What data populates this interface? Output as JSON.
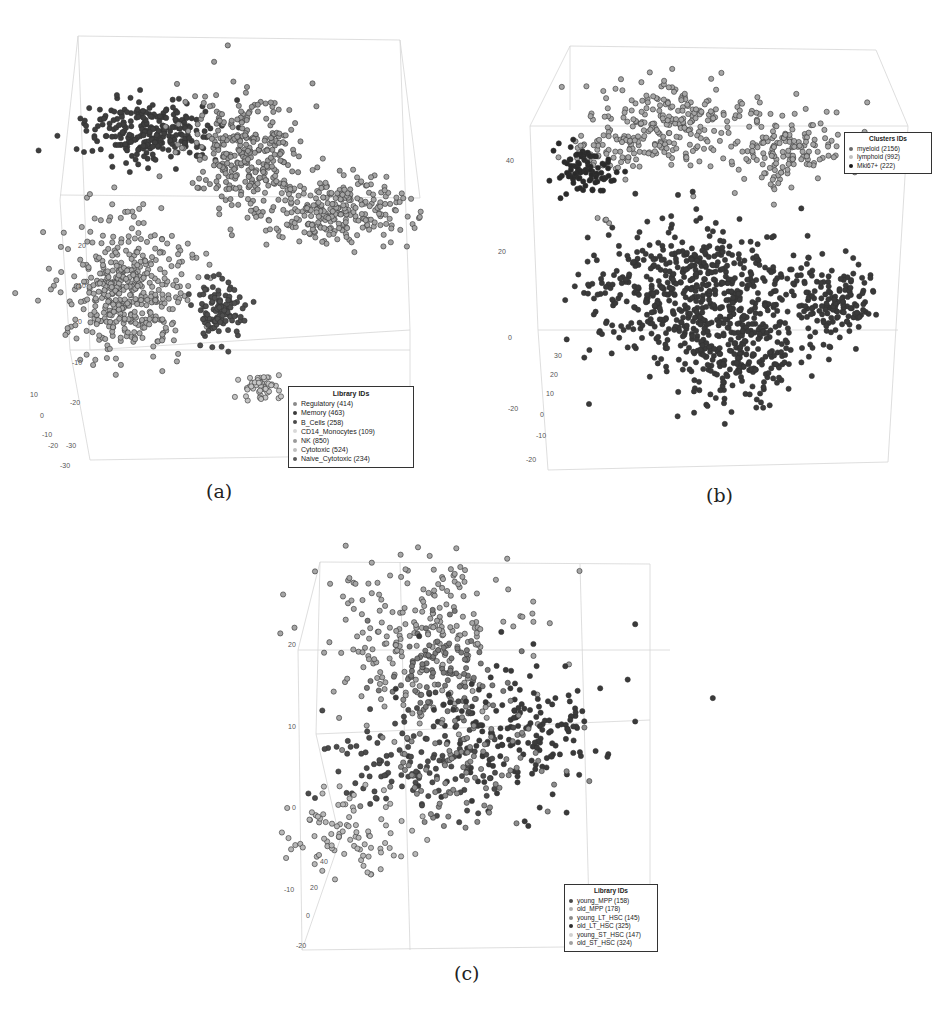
{
  "figure": {
    "captions": [
      "(a)",
      "(b)",
      "(c)"
    ]
  },
  "chart_data": [
    {
      "type": "scatter",
      "subtype": "3d-scatter",
      "panel": "(a)",
      "title": "",
      "legend_title": "Library IDs",
      "legend_position": "bottom-right",
      "series": [
        {
          "name": "Regulatory (414)",
          "count": 414,
          "color": "#8a8a8a",
          "cluster_center": [
            255,
            160
          ],
          "spread": [
            45,
            40
          ]
        },
        {
          "name": "Memory (463)",
          "count": 463,
          "color": "#3a3a3a",
          "cluster_center": [
            155,
            132
          ],
          "spread": [
            45,
            25
          ]
        },
        {
          "name": "B_Cells (258)",
          "count": 258,
          "color": "#4a4a4a",
          "cluster_center": [
            218,
            310
          ],
          "spread": [
            18,
            22
          ]
        },
        {
          "name": "CD14_Monocytes (109)",
          "count": 109,
          "color": "#d8d8d8",
          "cluster_center": [
            262,
            388
          ],
          "spread": [
            14,
            12
          ]
        },
        {
          "name": "NK (850)",
          "count": 850,
          "color": "#9a9a9a",
          "cluster_center": [
            128,
            290
          ],
          "spread": [
            45,
            45
          ]
        },
        {
          "name": "Cytotoxic (524)",
          "count": 524,
          "color": "#a8a8a8",
          "cluster_center": [
            320,
            210
          ],
          "spread": [
            55,
            28
          ]
        },
        {
          "name": "Naive_Cytotoxic (234)",
          "count": 234,
          "color": "#5a5a5a",
          "cluster_center": [
            200,
            130
          ],
          "spread": [
            20,
            15
          ]
        }
      ],
      "axis_ticks": {
        "z": [
          "20",
          "10",
          "0",
          "-10",
          "-20"
        ],
        "y": [
          "10",
          "0",
          "-10",
          "-20",
          "-30"
        ],
        "x": [
          "-30",
          "-20",
          "-30"
        ]
      },
      "grid": false
    },
    {
      "type": "scatter",
      "subtype": "3d-scatter",
      "panel": "(b)",
      "legend_title": "Clusters IDs",
      "legend_position": "top-right",
      "series": [
        {
          "name": "myeloid (2156)",
          "count": 2156,
          "color": "#3c3c3c"
        },
        {
          "name": "lymphoid (992)",
          "count": 992,
          "color": "#a0a0a0"
        },
        {
          "name": "Mki67+ (222)",
          "count": 222,
          "color": "#1a1a1a"
        }
      ],
      "axis_ticks": {
        "z": [
          "40",
          "20",
          "0",
          "-20"
        ],
        "y": [
          "30",
          "20",
          "10",
          "0",
          "-10",
          "-20"
        ]
      },
      "grid": false
    },
    {
      "type": "scatter",
      "subtype": "3d-scatter",
      "panel": "(c)",
      "legend_title": "Library IDs",
      "legend_position": "bottom-right",
      "series": [
        {
          "name": "young_MPP (158)",
          "count": 158,
          "color": "#4a4a4a"
        },
        {
          "name": "old_MPP (178)",
          "count": 178,
          "color": "#b0b0b0"
        },
        {
          "name": "young_LT_HSC (145)",
          "count": 145,
          "color": "#8a8a8a"
        },
        {
          "name": "old_LT_HSC (325)",
          "count": 325,
          "color": "#2e2e2e"
        },
        {
          "name": "young_ST_HSC (147)",
          "count": 147,
          "color": "#c8c8c8"
        },
        {
          "name": "old_ST_HSC (324)",
          "count": 324,
          "color": "#a0a0a0"
        }
      ],
      "axis_ticks": {
        "z": [
          "20",
          "10",
          "0",
          "-10",
          "-20"
        ],
        "y": [
          "40",
          "20",
          "0",
          "-20"
        ],
        "x": [
          "-20"
        ]
      },
      "grid": false
    }
  ]
}
